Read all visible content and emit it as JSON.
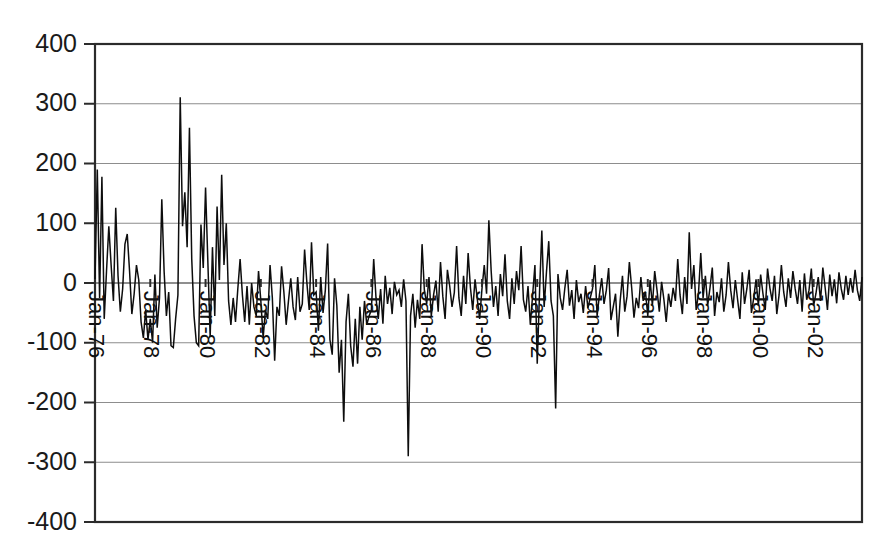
{
  "chart_data": {
    "type": "line",
    "title": "",
    "subtitle": "",
    "xlabel": "",
    "ylabel": "",
    "ylim": [
      -400,
      400
    ],
    "y_ticks": [
      400,
      300,
      200,
      100,
      0,
      -100,
      -200,
      -300,
      -400
    ],
    "y_tick_labels": [
      "400",
      "300",
      "200",
      "100",
      "0",
      "-100",
      "-200",
      "-300",
      "-400"
    ],
    "grid": true,
    "grid_axis": "y",
    "legend": false,
    "legend_position": "none",
    "x_tick_labels": [
      "Jan-76",
      "Jan-78",
      "Jan-80",
      "Jan-82",
      "Jan-84",
      "Jan-86",
      "Jan-88",
      "Jan-90",
      "Jan-92",
      "Jan-94",
      "Jan-96",
      "Jan-98",
      "Jan-00",
      "Jan-02"
    ],
    "x_tick_rotation": 90,
    "x_start": "Jan-76",
    "x_end": "Jun-03",
    "x_interval_months": 1,
    "x_tick_interval_months": 24,
    "line_color": "#0d0d0d",
    "grid_color": "#8d8d8d",
    "frame_color": "#2b2b2b",
    "background_color": "#ffffff",
    "series": [
      {
        "name": "series-1",
        "values": [
          5,
          190,
          -25,
          178,
          -60,
          20,
          95,
          30,
          -30,
          126,
          12,
          -48,
          -10,
          65,
          82,
          20,
          -52,
          -18,
          30,
          5,
          -65,
          -92,
          -45,
          -95,
          -60,
          -100,
          14,
          -75,
          -25,
          140,
          20,
          -55,
          -15,
          -105,
          -108,
          -60,
          -20,
          311,
          95,
          152,
          60,
          260,
          40,
          -55,
          -100,
          -105,
          98,
          25,
          160,
          35,
          -90,
          60,
          -55,
          128,
          5,
          181,
          30,
          100,
          -30,
          -70,
          -25,
          -65,
          -10,
          40,
          -20,
          -65,
          -5,
          -70,
          0,
          -40,
          -55,
          20,
          -30,
          -92,
          -45,
          -60,
          30,
          -25,
          -130,
          -40,
          -55,
          28,
          -15,
          -70,
          -30,
          8,
          -40,
          -62,
          10,
          -48,
          -35,
          56,
          0,
          -45,
          68,
          -20,
          -15,
          -80,
          10,
          -50,
          -12,
          66,
          -95,
          -120,
          8,
          -38,
          -150,
          -95,
          -232,
          -65,
          -18,
          -105,
          -140,
          -60,
          -135,
          -40,
          -95,
          -30,
          -70,
          -55,
          -45,
          40,
          -25,
          -60,
          -10,
          -68,
          12,
          -35,
          -8,
          -52,
          2,
          -20,
          -12,
          -40,
          6,
          -30,
          -290,
          -55,
          -18,
          -75,
          -28,
          -60,
          65,
          -12,
          -35,
          10,
          -55,
          -20,
          4,
          -48,
          35,
          -22,
          -60,
          22,
          -5,
          -40,
          -16,
          62,
          -25,
          -55,
          12,
          -35,
          50,
          -8,
          -45,
          6,
          -28,
          -60,
          -10,
          30,
          -18,
          105,
          20,
          -40,
          -5,
          -55,
          15,
          -22,
          48,
          -30,
          -60,
          8,
          -35,
          20,
          -12,
          62,
          -28,
          -48,
          -5,
          -70,
          -20,
          30,
          -135,
          -15,
          88,
          -40,
          18,
          70,
          -30,
          -55,
          -210,
          15,
          -25,
          -45,
          -8,
          22,
          -38,
          -12,
          -60,
          5,
          -32,
          -18,
          -50,
          -5,
          -42,
          -25,
          -10,
          30,
          -55,
          -20,
          8,
          -35,
          -12,
          25,
          -62,
          -40,
          -18,
          -90,
          -30,
          12,
          -48,
          -22,
          35,
          -8,
          -58,
          -25,
          -42,
          10,
          -30,
          -15,
          -55,
          5,
          -38,
          20,
          -12,
          -48,
          2,
          -28,
          -65,
          -18,
          -40,
          -8,
          -30,
          40,
          -20,
          -52,
          10,
          -35,
          85,
          -10,
          30,
          -45,
          -18,
          50,
          -25,
          12,
          -38,
          -8,
          26,
          -55,
          -15,
          -32,
          8,
          -48,
          -20,
          35,
          -12,
          -42,
          5,
          -28,
          -60,
          18,
          -35,
          -10,
          22,
          -50,
          -25,
          6,
          -38,
          14,
          -18,
          -45,
          24,
          -8,
          -30,
          12,
          -52,
          -20,
          30,
          -15,
          -40,
          8,
          -25,
          20,
          -10,
          -35,
          5,
          -48,
          16,
          -28,
          -12,
          24,
          -38,
          -18,
          10,
          -30,
          26,
          -8,
          -45,
          14,
          -22,
          6,
          -34,
          18,
          -10,
          -28,
          12,
          -20,
          8,
          -16,
          22,
          -12,
          -30,
          10
        ]
      }
    ]
  }
}
